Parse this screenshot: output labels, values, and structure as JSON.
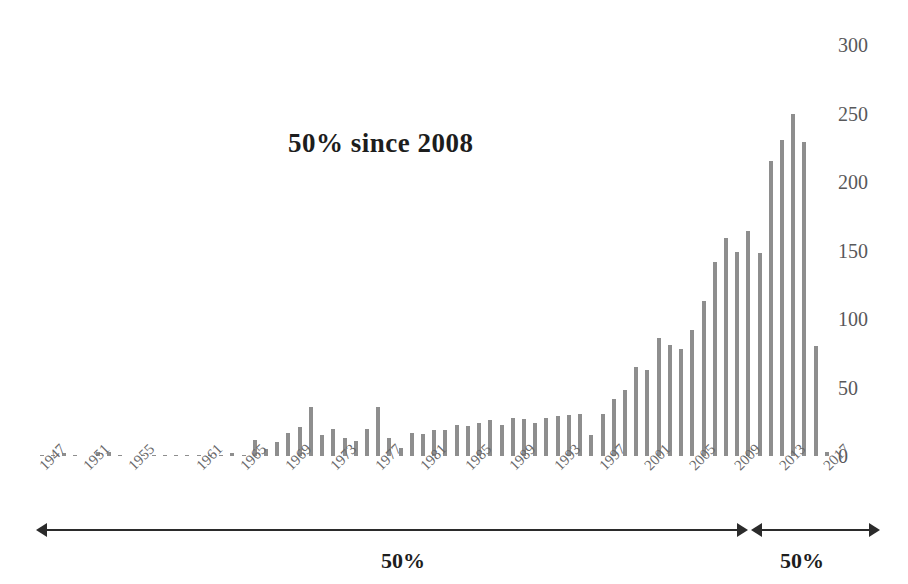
{
  "chart_data": {
    "type": "bar",
    "title": "50% since 2008",
    "xlabel": "",
    "ylabel": "",
    "ylim": [
      0,
      300
    ],
    "yticks": [
      0,
      50,
      100,
      150,
      200,
      250,
      300
    ],
    "grid": false,
    "legend": null,
    "bar_color": "#8e8e8e",
    "x_tick_labels": [
      "1947",
      "1951",
      "1955",
      "1961",
      "1965",
      "1969",
      "1973",
      "1977",
      "1981",
      "1985",
      "1989",
      "1993",
      "1997",
      "2001",
      "2005",
      "2009",
      "2013",
      "2017"
    ],
    "categories": [
      "1947",
      "1948",
      "1949",
      "1950",
      "1951",
      "1952",
      "1953",
      "1954",
      "1955",
      "1956",
      "1957",
      "1958",
      "1959",
      "1960",
      "1961",
      "1962",
      "1963",
      "1964",
      "1965",
      "1966",
      "1967",
      "1968",
      "1969",
      "1970",
      "1971",
      "1972",
      "1973",
      "1974",
      "1975",
      "1976",
      "1977",
      "1978",
      "1979",
      "1980",
      "1981",
      "1982",
      "1983",
      "1984",
      "1985",
      "1986",
      "1987",
      "1988",
      "1989",
      "1990",
      "1991",
      "1992",
      "1993",
      "1994",
      "1995",
      "1996",
      "1997",
      "1998",
      "1999",
      "2000",
      "2001",
      "2002",
      "2003",
      "2004",
      "2005",
      "2006",
      "2007",
      "2008",
      "2009",
      "2010",
      "2011",
      "2012",
      "2013",
      "2014",
      "2015",
      "2016",
      "2017"
    ],
    "values": [
      1,
      1,
      2,
      1,
      0,
      3,
      3,
      1,
      0,
      1,
      1,
      1,
      1,
      1,
      1,
      1,
      1,
      2,
      1,
      12,
      5,
      10,
      17,
      21,
      36,
      15,
      20,
      13,
      11,
      20,
      36,
      13,
      6,
      17,
      16,
      19,
      19,
      23,
      22,
      24,
      26,
      23,
      28,
      27,
      24,
      28,
      29,
      30,
      31,
      15,
      31,
      42,
      48,
      65,
      63,
      86,
      81,
      78,
      92,
      113,
      142,
      159,
      149,
      164,
      148,
      215,
      231,
      250,
      229,
      80,
      3
    ],
    "annotations": [
      {
        "name": "title-annotation",
        "text": "50% since 2008"
      },
      {
        "name": "left-span-label",
        "text": "50%"
      },
      {
        "name": "right-span-label",
        "text": "50%"
      }
    ]
  },
  "axes": {
    "y_labels": [
      "300",
      "250",
      "200",
      "150",
      "100",
      "50",
      "0"
    ]
  },
  "annotation": {
    "left_label": "50%",
    "right_label": "50%"
  },
  "caption": {
    "partial_text": ""
  }
}
